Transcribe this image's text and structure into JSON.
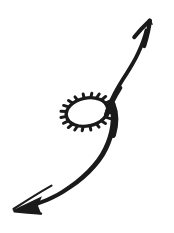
{
  "canvas": {
    "width": 174,
    "height": 233,
    "background_color": "#ffffff",
    "ink_color": "#1a1a1a",
    "title": "Hand-drawn double-headed curved arrow with spiky oval"
  },
  "drawing": {
    "style": "hand-drawn ink sketch",
    "description": "An S-shaped curved double arrow running from lower-left to upper-right, passing through a spiky starburst oval near the center-left",
    "elements": [
      {
        "name": "upper-curve",
        "label": "Upper rising curve",
        "from": [
          112,
          112
        ],
        "to": [
          149,
          26
        ],
        "stroke_width_start": 5.5,
        "stroke_width_end": 3.0
      },
      {
        "name": "up-arrowhead",
        "label": "Open chevron arrowhead pointing up-right",
        "tip": [
          150,
          20
        ],
        "left_barb": [
          134,
          37
        ],
        "right_barb": [
          144,
          46
        ],
        "fill": "none",
        "stroke_width": 4.0
      },
      {
        "name": "lower-curve",
        "label": "Lower descending curve",
        "from": [
          112,
          112
        ],
        "to": [
          20,
          207
        ],
        "stroke_width_start": 6.0,
        "stroke_width_end": 2.0
      },
      {
        "name": "down-left-arrowhead",
        "label": "Filled barbed arrowhead pointing down-left",
        "tip": [
          13,
          210
        ],
        "upper_barb": [
          51,
          186
        ],
        "lower_barb": [
          40,
          213
        ],
        "fill": "#1a1a1a"
      },
      {
        "name": "spiky-oval",
        "label": "Spiky starburst oval (sun scribble)",
        "center": [
          87,
          112
        ],
        "radius_x": 22,
        "radius_y": 15,
        "rotation_deg": -12,
        "spike_count": 18,
        "spike_length": 5,
        "stroke_width": 3.2
      }
    ]
  },
  "annotations": {
    "stroke_color": "#1a1a1a",
    "background_color": "#ffffff",
    "arrow_count": 2,
    "oval_count": 1
  }
}
